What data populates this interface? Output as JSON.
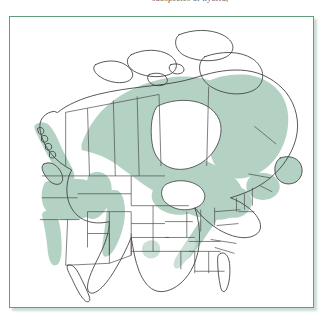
{
  "figure": {
    "kind": "species-range-map",
    "caption_partial": "subspecies or hybrid,",
    "caption_visible": false,
    "frame_color": "#5f9e79",
    "background_color": "#ffffff",
    "shadow_color": "#8cb49e"
  },
  "map": {
    "title": "",
    "region": "North America",
    "projection_look": "polar-ish conic, Alaska at left, Greenland omitted",
    "outline_color": "#3a3a3a",
    "internal_border_color": "#4a4a4a",
    "water_fill": "#ffffff",
    "legend_present": false,
    "labels_present": false,
    "range_fill": "#b4d2c4",
    "range_fill_soft": "#cbe0d6"
  },
  "range_regions": {
    "shaded": [
      "Alaska panhandle and coastal British Columbia",
      "Vancouver Island and Puget Sound",
      "Cascade Range, Washington and Oregon",
      "Northern California coast ranges and Sierra Nevada",
      "Idaho and western Montana Rockies",
      "Central and southern Rocky Mountains corridor",
      "Boreal interior of Yukon, Northwest Territories and northern Alberta",
      "Northern Saskatchewan and Manitoba",
      "Ontario and Quebec boreal belt",
      "Upper Great Lakes: Minnesota, Wisconsin, Michigan",
      "New England and the Adirondacks",
      "Appalachian Mountains south to Georgia",
      "Labrador, Newfoundland, Nova Scotia and New Brunswick"
    ],
    "unshaded": [
      "Canadian Arctic Archipelago",
      "Hudson Bay and the Great Lakes (water)",
      "Great Plains and prairie provinces interior",
      "Great Basin and Desert Southwest",
      "Texas and the Gulf Coastal Plain",
      "Florida peninsula",
      "Baja California and mainland Mexico"
    ]
  }
}
